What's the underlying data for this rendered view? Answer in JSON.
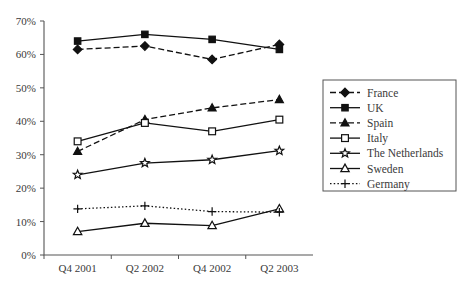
{
  "chart_data": {
    "type": "line",
    "title": "",
    "subtitle": "",
    "xlabel": "",
    "ylabel": "",
    "categories": [
      "Q4 2001",
      "Q2 2002",
      "Q4 2002",
      "Q2 2003"
    ],
    "ylim": [
      0,
      70
    ],
    "ytick_labels": [
      "0%",
      "10%",
      "20%",
      "30%",
      "40%",
      "50%",
      "60%",
      "70%"
    ],
    "ytick_values": [
      0,
      10,
      20,
      30,
      40,
      50,
      60,
      70
    ],
    "grid": false,
    "legend_position": "right",
    "series": [
      {
        "name": "France",
        "values": [
          61.5,
          62.5,
          58.5,
          63.0
        ],
        "marker": "filled-diamond",
        "line_style": "dashed",
        "color": "#111111"
      },
      {
        "name": "UK",
        "values": [
          64.0,
          66.0,
          64.5,
          61.5
        ],
        "marker": "filled-square",
        "line_style": "solid",
        "color": "#111111"
      },
      {
        "name": "Spain",
        "values": [
          31.0,
          40.5,
          44.0,
          46.5
        ],
        "marker": "filled-triangle",
        "line_style": "dashed",
        "color": "#111111"
      },
      {
        "name": "Italy",
        "values": [
          34.0,
          39.5,
          37.0,
          40.5
        ],
        "marker": "open-square",
        "line_style": "solid",
        "color": "#111111"
      },
      {
        "name": "The Netherlands",
        "values": [
          24.0,
          27.5,
          28.5,
          31.2
        ],
        "marker": "open-star",
        "line_style": "solid",
        "color": "#111111"
      },
      {
        "name": "Sweden",
        "values": [
          7.0,
          9.5,
          8.8,
          13.8
        ],
        "marker": "open-triangle",
        "line_style": "solid",
        "color": "#111111"
      },
      {
        "name": "Germany",
        "values": [
          13.8,
          14.7,
          13.0,
          12.8
        ],
        "marker": "plus",
        "line_style": "dotted",
        "color": "#111111"
      }
    ]
  },
  "legend": {
    "entries": [
      {
        "label": "France"
      },
      {
        "label": "UK"
      },
      {
        "label": "Spain"
      },
      {
        "label": "Italy"
      },
      {
        "label": "The Netherlands"
      },
      {
        "label": "Sweden"
      },
      {
        "label": "Germany"
      }
    ]
  }
}
